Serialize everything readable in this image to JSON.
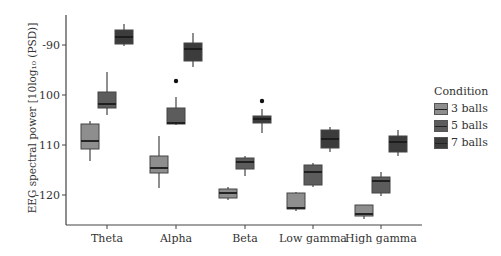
{
  "chart_data": {
    "type": "boxplot",
    "title": "",
    "xlabel": "",
    "ylabel": "EEG spectral power [10log10 (PSD)]",
    "ylabel_display": "EEG spectral power [10log₁₀ (PSD)]",
    "ylim": [
      -126,
      -84
    ],
    "yticks": [
      -90,
      -100,
      -110,
      -120
    ],
    "ytick_labels": [
      "-90",
      "100",
      "110",
      "-120"
    ],
    "categories": [
      "Theta",
      "Alpha",
      "Beta",
      "Low gamma",
      "High gamma"
    ],
    "legend": {
      "title": "Condition",
      "position": "right",
      "entries": [
        "3 balls",
        "5 balls",
        "7 balls"
      ]
    },
    "series": [
      {
        "name": "3 balls",
        "color": "#8e8e8e",
        "boxes": [
          {
            "whisker_high": -105.2,
            "q3": -105.8,
            "median": -109.2,
            "q1": -110.8,
            "whisker_low": -113.2,
            "outliers": []
          },
          {
            "whisker_high": -108.2,
            "q3": -112.2,
            "median": -114.6,
            "q1": -115.6,
            "whisker_low": -118.6,
            "outliers": []
          },
          {
            "whisker_high": -118.4,
            "q3": -118.8,
            "median": -119.6,
            "q1": -120.6,
            "whisker_low": -121.0,
            "outliers": []
          },
          {
            "whisker_high": -119.4,
            "q3": -119.6,
            "median": -122.6,
            "q1": -122.8,
            "whisker_low": -123.2,
            "outliers": []
          },
          {
            "whisker_high": -122.0,
            "q3": -122.0,
            "median": -123.8,
            "q1": -124.2,
            "whisker_low": -124.8,
            "outliers": []
          }
        ]
      },
      {
        "name": "5 balls",
        "color": "#5c5c5c",
        "boxes": [
          {
            "whisker_high": -95.4,
            "q3": -99.4,
            "median": -101.8,
            "q1": -102.6,
            "whisker_low": -104.0,
            "outliers": []
          },
          {
            "whisker_high": -100.4,
            "q3": -102.6,
            "median": -105.6,
            "q1": -105.8,
            "whisker_low": -106.0,
            "outliers": [
              -97.2
            ]
          },
          {
            "whisker_high": -112.2,
            "q3": -112.6,
            "median": -113.4,
            "q1": -114.8,
            "whisker_low": -116.2,
            "outliers": []
          },
          {
            "whisker_high": -113.6,
            "q3": -114.0,
            "median": -115.4,
            "q1": -118.0,
            "whisker_low": -118.4,
            "outliers": []
          },
          {
            "whisker_high": -115.4,
            "q3": -116.4,
            "median": -117.2,
            "q1": -119.6,
            "whisker_low": -120.2,
            "outliers": []
          }
        ]
      },
      {
        "name": "7 balls",
        "color": "#3c3c3c",
        "boxes": [
          {
            "whisker_high": -85.8,
            "q3": -87.0,
            "median": -88.4,
            "q1": -89.8,
            "whisker_low": -90.2,
            "outliers": []
          },
          {
            "whisker_high": -87.6,
            "q3": -89.6,
            "median": -90.8,
            "q1": -93.2,
            "whisker_low": -94.4,
            "outliers": []
          },
          {
            "whisker_high": -102.8,
            "q3": -104.2,
            "median": -104.8,
            "q1": -105.6,
            "whisker_low": -107.6,
            "outliers": [
              -101.2
            ]
          },
          {
            "whisker_high": -106.4,
            "q3": -107.0,
            "median": -108.8,
            "q1": -110.6,
            "whisker_low": -111.4,
            "outliers": []
          },
          {
            "whisker_high": -107.0,
            "q3": -108.2,
            "median": -109.4,
            "q1": -111.4,
            "whisker_low": -112.2,
            "outliers": []
          }
        ]
      }
    ],
    "grid": false
  }
}
